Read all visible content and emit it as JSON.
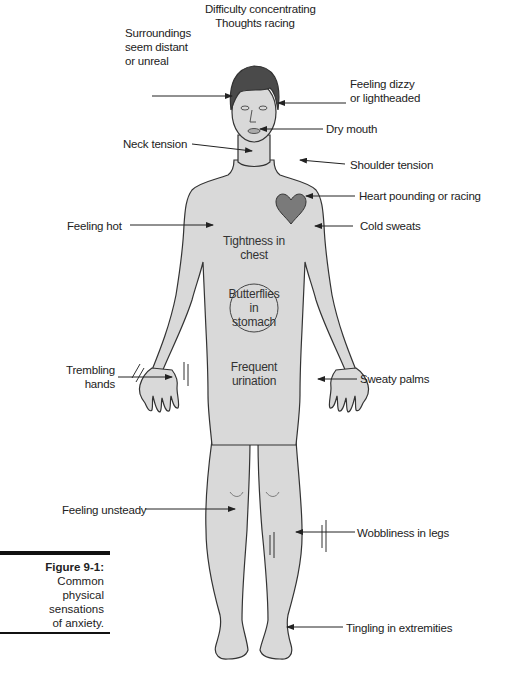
{
  "figure": {
    "number": "Figure 9-1:",
    "caption_lines": [
      "Common",
      "physical",
      "sensations",
      "of anxiety."
    ]
  },
  "labels": {
    "head_top_1": "Difficulty concentrating",
    "head_top_2": "Thoughts racing",
    "surroundings_1": "Surroundings",
    "surroundings_2": "seem distant",
    "surroundings_3": "or unreal",
    "dizzy_1": "Feeling dizzy",
    "dizzy_2": "or lightheaded",
    "dry_mouth": "Dry mouth",
    "neck_tension": "Neck tension",
    "shoulder_tension": "Shoulder tension",
    "heart": "Heart pounding or racing",
    "feeling_hot": "Feeling hot",
    "cold_sweats": "Cold sweats",
    "chest_1": "Tightness in",
    "chest_2": "chest",
    "stomach_1": "Butterflies",
    "stomach_2": "in",
    "stomach_3": "stomach",
    "trembling_1": "Trembling",
    "trembling_2": "hands",
    "urination_1": "Frequent",
    "urination_2": "urination",
    "sweaty_palms": "Sweaty palms",
    "unsteady": "Feeling unsteady",
    "wobbly_legs": "Wobbliness in legs",
    "tingling": "Tingling in extremities"
  },
  "colors": {
    "skin": "#d9d9d9",
    "outline": "#333333",
    "hair": "#4a4a4a",
    "heart": "#7a7a7a",
    "text": "#222222"
  }
}
